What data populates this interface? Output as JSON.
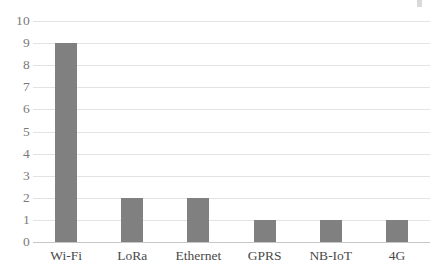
{
  "chart_data": {
    "type": "bar",
    "title": "",
    "subtitle": "",
    "xlabel": "",
    "ylabel": "",
    "categories": [
      "Wi-Fi",
      "LoRa",
      "Ethernet",
      "GPRS",
      "NB-IoT",
      "4G"
    ],
    "values": [
      9,
      2,
      2,
      1,
      1,
      1
    ],
    "ylim": [
      0,
      10
    ],
    "ytick_labels": [
      "10",
      "9",
      "8",
      "7",
      "6",
      "5",
      "4",
      "3",
      "2",
      "1",
      "0"
    ],
    "ytick_values": [
      10,
      9,
      8,
      7,
      6,
      5,
      4,
      3,
      2,
      1,
      0
    ],
    "grid": true,
    "grid_axis": "y",
    "legend": false,
    "legend_position": "none",
    "orientation": "vertical",
    "series": [
      {
        "name": "",
        "values": [
          9,
          2,
          2,
          1,
          1,
          1
        ]
      }
    ]
  },
  "style": {
    "bar_color": "#808080",
    "gridline_color": "#e3e3e3",
    "baseline_color": "#c6c6c6",
    "y_label_color": "#7a7a7a",
    "x_label_color": "#4a4a4a",
    "background_color": "#ffffff"
  }
}
